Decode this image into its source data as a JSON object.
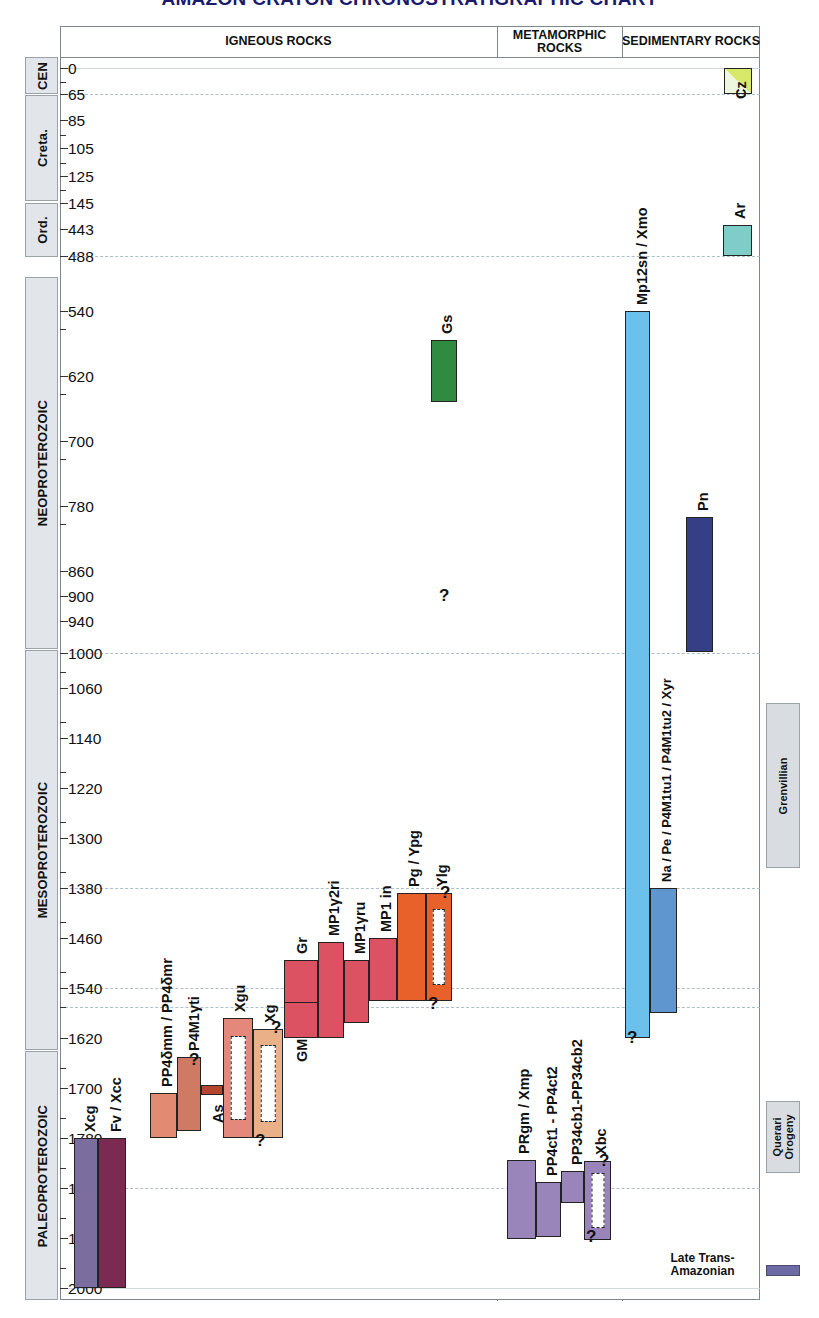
{
  "title": "AMAZON CRATON CHRONOSTRATIGRAPHIC CHART",
  "headers": [
    {
      "label": "IGNEOUS ROCKS",
      "left": 0,
      "width": 437
    },
    {
      "label": "METAMORPHIC ROCKS",
      "left": 437,
      "width": 125
    },
    {
      "label": "SEDIMENTARY ROCKS",
      "left": 562,
      "width": 138
    }
  ],
  "eras": [
    {
      "label": "CEN",
      "top": 0,
      "height": 37,
      "size": "normal"
    },
    {
      "label": "Creta.",
      "top": 38,
      "height": 106,
      "size": "normal"
    },
    {
      "label": "Ord.",
      "top": 146,
      "height": 54,
      "size": "normal"
    },
    {
      "label": "NEOPROTEROZOIC",
      "top": 220,
      "height": 372,
      "size": "normal"
    },
    {
      "label": "MESOPROTEROZOIC",
      "top": 593,
      "height": 400,
      "size": "normal"
    },
    {
      "label": "PALEOPROTEROZOIC",
      "top": 994,
      "height": 249,
      "size": "normal"
    }
  ],
  "axis": {
    "unit": "Ma",
    "ticks": [
      {
        "value": "0",
        "y": 11,
        "major": true,
        "grid": "solid"
      },
      {
        "value": "",
        "y": 25,
        "major": false,
        "grid": "none"
      },
      {
        "value": "65",
        "y": 37,
        "major": true,
        "grid": "dash"
      },
      {
        "value": "85",
        "y": 63,
        "major": true,
        "grid": "none"
      },
      {
        "value": "",
        "y": 78,
        "major": false,
        "grid": "none"
      },
      {
        "value": "105",
        "y": 91,
        "major": true,
        "grid": "none"
      },
      {
        "value": "",
        "y": 106,
        "major": false,
        "grid": "none"
      },
      {
        "value": "125",
        "y": 119,
        "major": true,
        "grid": "none"
      },
      {
        "value": "",
        "y": 133,
        "major": false,
        "grid": "none"
      },
      {
        "value": "145",
        "y": 146,
        "major": true,
        "grid": "none"
      },
      {
        "value": "443",
        "y": 172,
        "major": true,
        "grid": "none"
      },
      {
        "value": "488",
        "y": 199,
        "major": true,
        "grid": "dash"
      },
      {
        "value": "540",
        "y": 254,
        "major": true,
        "grid": "none"
      },
      {
        "value": "",
        "y": 272,
        "major": false,
        "grid": "none"
      },
      {
        "value": "620",
        "y": 319,
        "major": true,
        "grid": "none"
      },
      {
        "value": "",
        "y": 337,
        "major": false,
        "grid": "none"
      },
      {
        "value": "700",
        "y": 384,
        "major": true,
        "grid": "none"
      },
      {
        "value": "",
        "y": 402,
        "major": false,
        "grid": "none"
      },
      {
        "value": "780",
        "y": 449,
        "major": true,
        "grid": "none"
      },
      {
        "value": "",
        "y": 467,
        "major": false,
        "grid": "none"
      },
      {
        "value": "860",
        "y": 514,
        "major": true,
        "grid": "none"
      },
      {
        "value": "900",
        "y": 539,
        "major": true,
        "grid": "none"
      },
      {
        "value": "940",
        "y": 564,
        "major": true,
        "grid": "none"
      },
      {
        "value": "1000",
        "y": 596,
        "major": true,
        "grid": "dash"
      },
      {
        "value": "",
        "y": 615,
        "major": false,
        "grid": "none"
      },
      {
        "value": "1060",
        "y": 631,
        "major": true,
        "grid": "none"
      },
      {
        "value": "",
        "y": 665,
        "major": false,
        "grid": "none"
      },
      {
        "value": "1140",
        "y": 681,
        "major": true,
        "grid": "none"
      },
      {
        "value": "",
        "y": 715,
        "major": false,
        "grid": "none"
      },
      {
        "value": "1220",
        "y": 731,
        "major": true,
        "grid": "none"
      },
      {
        "value": "",
        "y": 765,
        "major": false,
        "grid": "none"
      },
      {
        "value": "1300",
        "y": 781,
        "major": true,
        "grid": "none"
      },
      {
        "value": "",
        "y": 815,
        "major": false,
        "grid": "none"
      },
      {
        "value": "1380",
        "y": 831,
        "major": true,
        "grid": "dash"
      },
      {
        "value": "",
        "y": 865,
        "major": false,
        "grid": "none"
      },
      {
        "value": "1460",
        "y": 881,
        "major": true,
        "grid": "none"
      },
      {
        "value": "",
        "y": 915,
        "major": false,
        "grid": "none"
      },
      {
        "value": "1540",
        "y": 931,
        "major": true,
        "grid": "dash"
      },
      {
        "value": "",
        "y": 950,
        "major": false,
        "grid": "dash"
      },
      {
        "value": "1620",
        "y": 981,
        "major": true,
        "grid": "none"
      },
      {
        "value": "",
        "y": 1011,
        "major": false,
        "grid": "none"
      },
      {
        "value": "1700",
        "y": 1031,
        "major": true,
        "grid": "none"
      },
      {
        "value": "",
        "y": 1061,
        "major": false,
        "grid": "none"
      },
      {
        "value": "1780",
        "y": 1081,
        "major": true,
        "grid": "none"
      },
      {
        "value": "",
        "y": 1111,
        "major": false,
        "grid": "none"
      },
      {
        "value": "1860",
        "y": 1131,
        "major": true,
        "grid": "dash"
      },
      {
        "value": "",
        "y": 1161,
        "major": false,
        "grid": "none"
      },
      {
        "value": "1940",
        "y": 1181,
        "major": true,
        "grid": "none"
      },
      {
        "value": "",
        "y": 1211,
        "major": false,
        "grid": "none"
      },
      {
        "value": "2000",
        "y": 1231,
        "major": true,
        "grid": "solid"
      }
    ]
  },
  "igneous_units": [
    {
      "code": "Xcg",
      "left": 14,
      "width": 24,
      "top": 1081,
      "height": 150,
      "color": "#7b6e9e",
      "hollow": false,
      "label_y": 1075,
      "label_x": 22,
      "q_top": null,
      "q_bot": null
    },
    {
      "code": "Fv / Xcc",
      "left": 38,
      "width": 28,
      "top": 1081,
      "height": 150,
      "color": "#7b2a52",
      "hollow": false,
      "label_y": 1075,
      "label_x": 48,
      "q_top": null,
      "q_bot": null
    },
    {
      "code": "PP4δmm / PP4δmr",
      "left": 90,
      "width": 27,
      "top": 1036,
      "height": 45,
      "color": "#e08b72",
      "hollow": false,
      "label_y": 1030,
      "label_x": 99,
      "q_top": null,
      "q_bot": null
    },
    {
      "code": "P4M1γti",
      "left": 117,
      "width": 24,
      "top": 1000,
      "height": 74,
      "color": "#cf7a62",
      "hollow": false,
      "label_y": 994,
      "label_x": 126,
      "q_top": 999,
      "q_bot": null
    },
    {
      "code": "As",
      "left": 141,
      "width": 22,
      "top": 1028,
      "height": 10,
      "color": "#b5452f",
      "hollow": false,
      "label_y": 1066,
      "label_x": 150,
      "q_top": null,
      "q_bot": null
    },
    {
      "code": "Xgu",
      "left": 163,
      "width": 30,
      "top": 961,
      "height": 120,
      "color": "#e4887c",
      "hollow": true,
      "label_y": 955,
      "label_x": 172,
      "q_top": null,
      "q_bot": null
    },
    {
      "code": "Xg",
      "left": 193,
      "width": 30,
      "top": 972,
      "height": 109,
      "color": "#eab189",
      "hollow": true,
      "label_y": 966,
      "label_x": 202,
      "q_top": 967,
      "q_bot": 1082
    },
    {
      "code": "GM",
      "left": 224,
      "width": 34,
      "top": 903,
      "height": 78,
      "color": "#dc5263",
      "hollow": false,
      "label_y": 1005,
      "label_x": 234,
      "q_top": null,
      "q_bot": null
    },
    {
      "code": "Gr",
      "left": 224,
      "width": 34,
      "top": 903,
      "height": 43,
      "color": "#dc5263",
      "hollow": false,
      "label_y": 897,
      "label_x": 234,
      "q_top": null,
      "q_bot": null
    },
    {
      "code": "MP1γ2ri",
      "left": 258,
      "width": 26,
      "top": 885,
      "height": 96,
      "color": "#dc5263",
      "hollow": false,
      "label_y": 879,
      "label_x": 266,
      "q_top": null,
      "q_bot": null
    },
    {
      "code": "MP1γru",
      "left": 284,
      "width": 25,
      "top": 903,
      "height": 63,
      "color": "#dc5263",
      "hollow": false,
      "label_y": 897,
      "label_x": 292,
      "q_top": null,
      "q_bot": null
    },
    {
      "code": "MP1 in",
      "left": 309,
      "width": 28,
      "top": 881,
      "height": 63,
      "color": "#dc5263",
      "hollow": false,
      "label_y": 875,
      "label_x": 318,
      "q_top": null,
      "q_bot": null
    },
    {
      "code": "Pg / Ypg",
      "left": 337,
      "width": 29,
      "top": 836,
      "height": 108,
      "color": "#e8602a",
      "hollow": false,
      "label_y": 830,
      "label_x": 346,
      "q_top": null,
      "q_bot": null
    },
    {
      "code": "Ylg",
      "left": 366,
      "width": 26,
      "top": 836,
      "height": 108,
      "color": "#e8602a",
      "hollow": true,
      "label_y": 830,
      "label_x": 374,
      "q_top": 832,
      "q_bot": 945
    },
    {
      "code": "Gs",
      "left": 371,
      "width": 26,
      "top": 283,
      "height": 62,
      "color": "#2f8b3f",
      "hollow": false,
      "label_y": 277,
      "label_x": 379,
      "q_top": null,
      "q_bot": null
    }
  ],
  "metamorphic_units": [
    {
      "code": "PRgm / Xmp",
      "left": 447,
      "width": 29,
      "top": 1103,
      "height": 79,
      "color": "#9a85bb",
      "hollow": false,
      "label_y": 1097,
      "label_x": 456,
      "q_top": null,
      "q_bot": null
    },
    {
      "code": "PP4ct1 - PP4ct2",
      "left": 476,
      "width": 25,
      "top": 1125,
      "height": 55,
      "color": "#9a85bb",
      "hollow": false,
      "label_y": 1119,
      "label_x": 484,
      "q_top": null,
      "q_bot": null
    },
    {
      "code": "PP34cb1-PP34cb2",
      "left": 501,
      "width": 23,
      "top": 1114,
      "height": 32,
      "color": "#9a85bb",
      "hollow": false,
      "label_y": 1108,
      "label_x": 509,
      "q_top": null,
      "q_bot": null
    },
    {
      "code": "Xbc",
      "left": 524,
      "width": 27,
      "top": 1104,
      "height": 79,
      "color": "#9a85bb",
      "hollow": true,
      "label_y": 1098,
      "label_x": 533,
      "q_top": 1100,
      "q_bot": 1178
    }
  ],
  "sedimentary_units": [
    {
      "code": "Cz",
      "left": 664,
      "width": 28,
      "top": 11,
      "height": 26,
      "color": "#d8e86a",
      "hollow": false,
      "label_y": 42,
      "label_x": 673,
      "q_top": null,
      "q_bot": null,
      "split": true
    },
    {
      "code": "Ar",
      "left": 663,
      "width": 29,
      "top": 168,
      "height": 31,
      "color": "#7fcdc9",
      "hollow": false,
      "label_y": 162,
      "label_x": 672,
      "q_top": null,
      "q_bot": null,
      "split": false
    },
    {
      "code": "Mp12sn / Xmo",
      "left": 565,
      "width": 25,
      "top": 254,
      "height": 727,
      "color": "#6bc0ec",
      "hollow": false,
      "label_y": 248,
      "label_x": 574,
      "q_top": null,
      "q_bot": 979,
      "split": false
    },
    {
      "code": "Na / Pe / P4M1tu1 / P4M1tu2 / Xyr",
      "left": 590,
      "width": 27,
      "top": 831,
      "height": 125,
      "color": "#5f96d0",
      "hollow": false,
      "label_y": 825,
      "label_x": 599,
      "q_top": null,
      "q_bot": null,
      "split": false
    },
    {
      "code": "Pn",
      "left": 626,
      "width": 27,
      "top": 460,
      "height": 135,
      "color": "#343f85",
      "hollow": false,
      "label_y": 454,
      "label_x": 635,
      "q_top": null,
      "q_bot": null,
      "split": false
    }
  ],
  "orogenies": [
    {
      "label": "Grenvillian",
      "top": 646,
      "height": 165
    },
    {
      "label": "Querari\nOrogeny",
      "top": 1044,
      "height": 72
    }
  ],
  "legend": {
    "label": "Late Trans-\nAmazonian",
    "swatch_color": "#6d6ba3"
  }
}
